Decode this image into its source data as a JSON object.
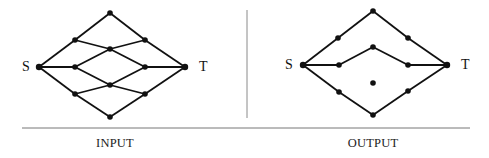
{
  "panels": [
    {
      "id": "input",
      "caption": "INPUT",
      "source_label": "S",
      "sink_label": "T",
      "nodes": {
        "S": [
          39,
          67
        ],
        "A": [
          110,
          13
        ],
        "B": [
          75,
          40
        ],
        "C": [
          145,
          40
        ],
        "D": [
          110,
          49
        ],
        "E": [
          75,
          67
        ],
        "F": [
          145,
          67
        ],
        "T": [
          185,
          67
        ],
        "G": [
          110,
          85
        ],
        "H": [
          75,
          94
        ],
        "I": [
          145,
          94
        ],
        "J": [
          110,
          117
        ]
      },
      "edges": [
        [
          "S",
          "B"
        ],
        [
          "B",
          "A"
        ],
        [
          "A",
          "C"
        ],
        [
          "C",
          "T"
        ],
        [
          "B",
          "D"
        ],
        [
          "D",
          "F"
        ],
        [
          "C",
          "D"
        ],
        [
          "D",
          "E"
        ],
        [
          "S",
          "E"
        ],
        [
          "F",
          "T"
        ],
        [
          "E",
          "G"
        ],
        [
          "G",
          "I"
        ],
        [
          "F",
          "G"
        ],
        [
          "G",
          "H"
        ],
        [
          "S",
          "H"
        ],
        [
          "H",
          "J"
        ],
        [
          "J",
          "I"
        ],
        [
          "I",
          "T"
        ]
      ]
    },
    {
      "id": "output",
      "caption": "OUTPUT",
      "source_label": "S",
      "sink_label": "T",
      "nodes": {
        "S": [
          303,
          65
        ],
        "A": [
          373,
          11
        ],
        "B": [
          338,
          38
        ],
        "C": [
          408,
          38
        ],
        "D": [
          373,
          47
        ],
        "E": [
          339,
          65
        ],
        "F": [
          408,
          65
        ],
        "T": [
          447,
          65
        ],
        "G": [
          373,
          83
        ],
        "H": [
          339,
          92
        ],
        "I": [
          408,
          91
        ],
        "J": [
          373,
          115
        ]
      },
      "edges": [
        [
          "S",
          "B"
        ],
        [
          "B",
          "A"
        ],
        [
          "A",
          "C"
        ],
        [
          "C",
          "T"
        ],
        [
          "S",
          "E"
        ],
        [
          "E",
          "D"
        ],
        [
          "D",
          "F"
        ],
        [
          "F",
          "T"
        ],
        [
          "S",
          "H"
        ],
        [
          "H",
          "J"
        ],
        [
          "J",
          "I"
        ],
        [
          "I",
          "T"
        ]
      ]
    }
  ],
  "colors": {
    "ink": "#111111",
    "rule": "#777777"
  }
}
